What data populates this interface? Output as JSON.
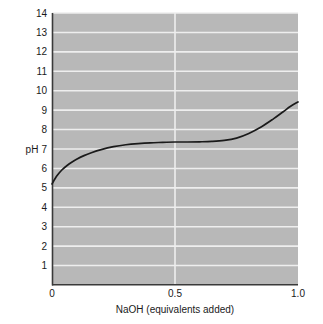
{
  "chart_data": {
    "type": "line",
    "title": "",
    "subtitle": "",
    "xlabel": "NaOH (equivalents added)",
    "ylabel": "pH",
    "xlim": [
      0,
      1.0
    ],
    "ylim": [
      0,
      14
    ],
    "grid": true,
    "legend": false,
    "legend_position": "none",
    "xticks": [
      0,
      0.5,
      1.0
    ],
    "xtick_labels": [
      "0",
      "0.5",
      "1.0"
    ],
    "yticks": [
      1,
      2,
      3,
      4,
      5,
      6,
      7,
      8,
      9,
      10,
      11,
      12,
      13,
      14
    ],
    "ytick_labels": [
      "1",
      "2",
      "3",
      "4",
      "5",
      "6",
      "7",
      "8",
      "9",
      "10",
      "11",
      "12",
      "13",
      "14"
    ],
    "series": [
      {
        "name": "titration curve",
        "x": [
          0.0,
          0.02,
          0.04,
          0.06,
          0.08,
          0.1,
          0.13,
          0.16,
          0.2,
          0.25,
          0.3,
          0.35,
          0.4,
          0.45,
          0.5,
          0.55,
          0.6,
          0.65,
          0.7,
          0.75,
          0.8,
          0.85,
          0.9,
          0.94,
          0.97,
          1.0
        ],
        "y": [
          5.2,
          5.62,
          5.92,
          6.14,
          6.32,
          6.47,
          6.66,
          6.81,
          6.97,
          7.12,
          7.22,
          7.28,
          7.32,
          7.34,
          7.36,
          7.36,
          7.37,
          7.39,
          7.44,
          7.56,
          7.8,
          8.13,
          8.55,
          8.92,
          9.2,
          9.42
        ]
      }
    ]
  },
  "axis": {
    "ylabel_text": "pH",
    "xlabel_text": "NaOH (equivalents added)"
  },
  "colors": {
    "plot_background": "#b8b8b8",
    "gridline": "#eeeeee",
    "axis_line": "#3a3a3a",
    "curve": "#1a1a1a",
    "text": "#1a1a1a",
    "page_background": "#ffffff"
  }
}
